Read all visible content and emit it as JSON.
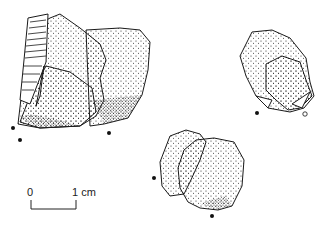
{
  "figure": {
    "artifacts": [
      {
        "id": "artifact-left",
        "description": "large stippled flake with ridged edge"
      },
      {
        "id": "artifact-right",
        "description": "small stippled flake"
      },
      {
        "id": "artifact-bottom",
        "description": "paired stippled flakes"
      }
    ],
    "scale_bar": {
      "start_label": "0",
      "end_label": "1 cm"
    },
    "colors": {
      "ink": "#1a1a1a",
      "background": "#ffffff"
    }
  }
}
